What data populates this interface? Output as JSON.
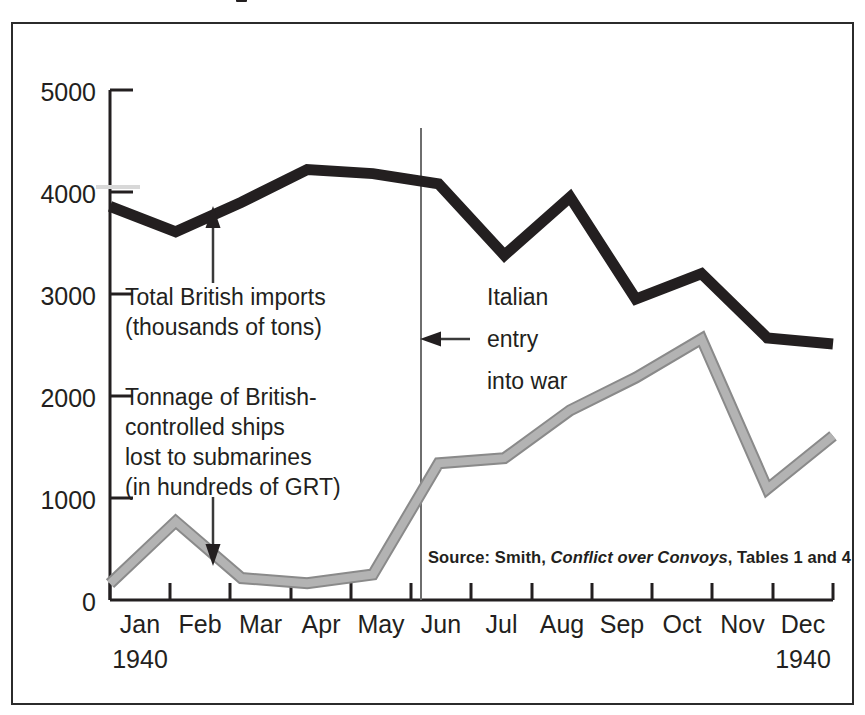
{
  "figure": {
    "border_color": "#2b2b2b",
    "background": "#ffffff"
  },
  "axes": {
    "y_ticks": [
      "5000",
      "4000",
      "3000",
      "2000",
      "1000",
      "0"
    ],
    "y_tick_values": [
      5000,
      4000,
      3000,
      2000,
      1000,
      0
    ],
    "x_ticks": [
      "Jan",
      "Feb",
      "Mar",
      "Apr",
      "May",
      "Jun",
      "Jul",
      "Aug",
      "Sep",
      "Oct",
      "Nov",
      "Dec"
    ],
    "x_year_start": "1940",
    "x_year_end": "1940"
  },
  "annotations": {
    "imports": {
      "line1": "Total British imports",
      "line2": "(thousands of tons)"
    },
    "losses": {
      "line1": "Tonnage of British-",
      "line2": "controlled ships",
      "line3": "lost to submarines",
      "line4": "(in hundreds of GRT)"
    },
    "italian_entry": {
      "line1": "Italian",
      "line2": "entry",
      "line3": "into war"
    }
  },
  "source_note": {
    "prefix": "Source:  Smith, ",
    "italic_title": "Conflict over Convoys",
    "suffix": ", Tables 1 and 4"
  },
  "chart_data": {
    "type": "line",
    "title": "",
    "xlabel": "",
    "ylabel": "",
    "grid": false,
    "legend": "annotations-with-arrows",
    "xlim": [
      "Jan 1940",
      "Dec 1940"
    ],
    "ylim": [
      0,
      5000
    ],
    "categories": [
      "Jan",
      "Feb",
      "Mar",
      "Apr",
      "May",
      "Jun",
      "Jul",
      "Aug",
      "Sep",
      "Oct",
      "Nov",
      "Dec"
    ],
    "series": [
      {
        "name": "Total British imports (thousands of tons)",
        "color": "#231f20",
        "style": "thick-black",
        "values": [
          3860,
          3610,
          3900,
          4220,
          4180,
          4080,
          3380,
          3950,
          2950,
          3200,
          2570,
          2510
        ]
      },
      {
        "name": "Tonnage of British-controlled ships lost to submarines (in hundreds of GRT)",
        "color": "#b3b3b3",
        "outline_color": "#8a8a8a",
        "style": "thick-grey-outlined",
        "values": [
          160,
          770,
          215,
          165,
          250,
          1340,
          1390,
          1860,
          2180,
          2560,
          1090,
          1610
        ]
      }
    ],
    "event_marker": {
      "label": "Italian entry into war",
      "at": "Jun",
      "type": "vertical-line"
    }
  }
}
